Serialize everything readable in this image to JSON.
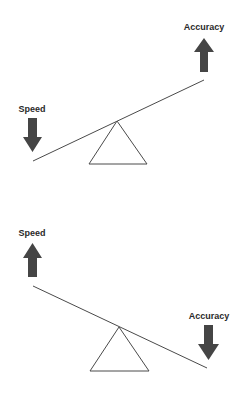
{
  "diagram": {
    "type": "seesaw-tradeoff",
    "panels": [
      {
        "id": "top",
        "left_label": "Speed",
        "left_arrow": "down",
        "right_label": "Accuracy",
        "right_arrow": "up",
        "tilt": "left-down"
      },
      {
        "id": "bottom",
        "left_label": "Speed",
        "left_arrow": "up",
        "right_label": "Accuracy",
        "right_arrow": "down",
        "tilt": "right-down"
      }
    ],
    "colors": {
      "arrow": "#454545",
      "line": "#4a4a4a",
      "text": "#2a2a2a",
      "background": "#ffffff"
    }
  }
}
